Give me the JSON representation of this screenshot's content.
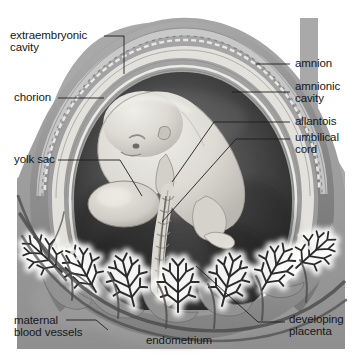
{
  "figure": {
    "style": "grayscale anatomical illustration",
    "width": 359,
    "height": 358
  },
  "colors": {
    "page_background": "#ffffff",
    "plate_background": "#a9a9a9",
    "endometrium_fill": "#9a9a9a",
    "placenta_fill": "#8f8f8f",
    "villi_halo": "#f2f2f2",
    "villi_stroke": "#2e2e2e",
    "amnionic_cavity_dark": "#3a3a3a",
    "amnionic_cavity_mid": "#555555",
    "embryo_fill": "#d8d6cf",
    "chorion_band": "#e6e4df",
    "outer_ring": "#8a8a8a",
    "label_text": "#15171a",
    "leader_line": "#1d1d1d"
  },
  "labels": {
    "extraembryonic_cavity": {
      "id": "extraembryonic-cavity",
      "lines": [
        "extraembryonic",
        "cavity"
      ],
      "line1": "extraembryonic",
      "line2": "cavity",
      "side": "left",
      "x": 10,
      "y": 30
    },
    "chorion": {
      "id": "chorion",
      "lines": [
        "chorion"
      ],
      "line1": "chorion",
      "side": "left",
      "x": 14,
      "y": 92
    },
    "yolk_sac": {
      "id": "yolk-sac",
      "lines": [
        "yolk sac"
      ],
      "line1": "yolk sac",
      "side": "left",
      "x": 14,
      "y": 155
    },
    "maternal_blood_vessels": {
      "id": "maternal-blood-vessels",
      "lines": [
        "maternal",
        "blood vessels"
      ],
      "line1": "maternal",
      "line2": "blood vessels",
      "side": "left",
      "x": 14,
      "y": 315
    },
    "amnion": {
      "id": "amnion",
      "lines": [
        "amnion"
      ],
      "line1": "amnion",
      "side": "right",
      "x": 292,
      "y": 58
    },
    "amnionic_cavity": {
      "id": "amnionic-cavity",
      "lines": [
        "amnionic",
        "cavity"
      ],
      "line1": "amnionic",
      "line2": "cavity",
      "side": "right",
      "x": 292,
      "y": 81
    },
    "allantois": {
      "id": "allantois",
      "lines": [
        "allantois"
      ],
      "line1": "allantois",
      "side": "right",
      "x": 292,
      "y": 116
    },
    "umbilical_cord": {
      "id": "umbilical-cord",
      "lines": [
        "umbilical",
        "cord"
      ],
      "line1": "umbilical",
      "line2": "cord",
      "side": "right",
      "x": 292,
      "y": 132
    },
    "developing_placenta": {
      "id": "developing-placenta",
      "lines": [
        "developing",
        "placenta"
      ],
      "line1": "developing",
      "line2": "placenta",
      "side": "right",
      "x": 287,
      "y": 314
    },
    "endometrium": {
      "id": "endometrium",
      "lines": [
        "endometrium"
      ],
      "line1": "endometrium",
      "side": "bottom",
      "x": 146,
      "y": 335
    }
  },
  "structures": [
    {
      "name": "extraembryonic cavity",
      "description": "space between chorion and amnion"
    },
    {
      "name": "chorion",
      "description": "outermost fetal membrane with villi"
    },
    {
      "name": "yolk sac",
      "description": "small ovoid sac below the embryo"
    },
    {
      "name": "amnion",
      "description": "inner membrane enclosing the embryo"
    },
    {
      "name": "amnionic cavity",
      "description": "fluid-filled space around the embryo"
    },
    {
      "name": "allantois",
      "description": "tube running within the umbilical cord"
    },
    {
      "name": "umbilical cord",
      "description": "twisted cord joining embryo to placenta"
    },
    {
      "name": "developing placenta",
      "description": "villous mass at the base of the chorion"
    },
    {
      "name": "maternal blood vessels",
      "description": "vessels in the uterine wall"
    },
    {
      "name": "endometrium",
      "description": "uterine lining surrounding the conceptus"
    }
  ]
}
